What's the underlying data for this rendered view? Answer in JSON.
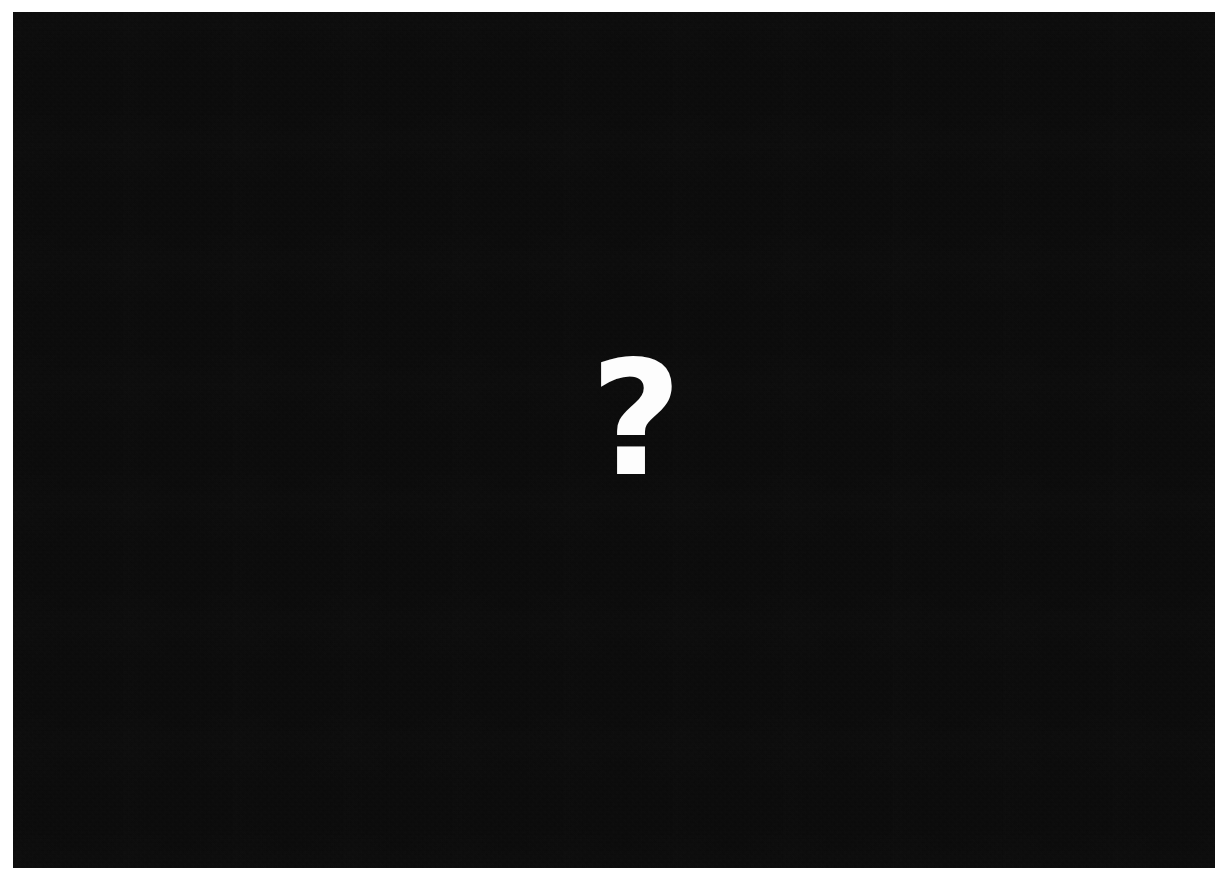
{
  "canvas": {
    "width_px": 1221,
    "height_px": 885,
    "page_background_color": "#ffffff"
  },
  "placeholder_panel": {
    "description": "Large near-black rectangular panel occupying almost the entire frame, indicating unavailable or unrenderable content.",
    "background_color": "#0a0a0a",
    "left_px": 13,
    "top_px": 12,
    "width_px": 1202,
    "height_px": 856,
    "texture": "fine compression noise",
    "content_state": "unavailable"
  },
  "unknown_indicator": {
    "glyph": "?",
    "icon_name": "question-mark-icon",
    "color": "#fdfdfd",
    "center_x_px": 623,
    "center_y_px": 407,
    "glyph_width_px": 48,
    "glyph_height_px": 116,
    "weight": "bold",
    "meaning": "content unknown or unavailable"
  }
}
